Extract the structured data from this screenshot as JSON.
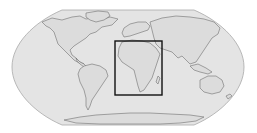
{
  "map": {
    "projection": "robinson",
    "view": "world",
    "colors": {
      "background": "#ffffff",
      "ocean": "#e4e4e4",
      "land": "#dcdcdc",
      "coastline": "#6e6e6e",
      "frame": "#a8a8a8",
      "highlight_box": "#111111"
    },
    "highlight": {
      "region": "Africa",
      "box": {
        "x": 115,
        "y": 41,
        "width": 47,
        "height": 54
      }
    }
  }
}
